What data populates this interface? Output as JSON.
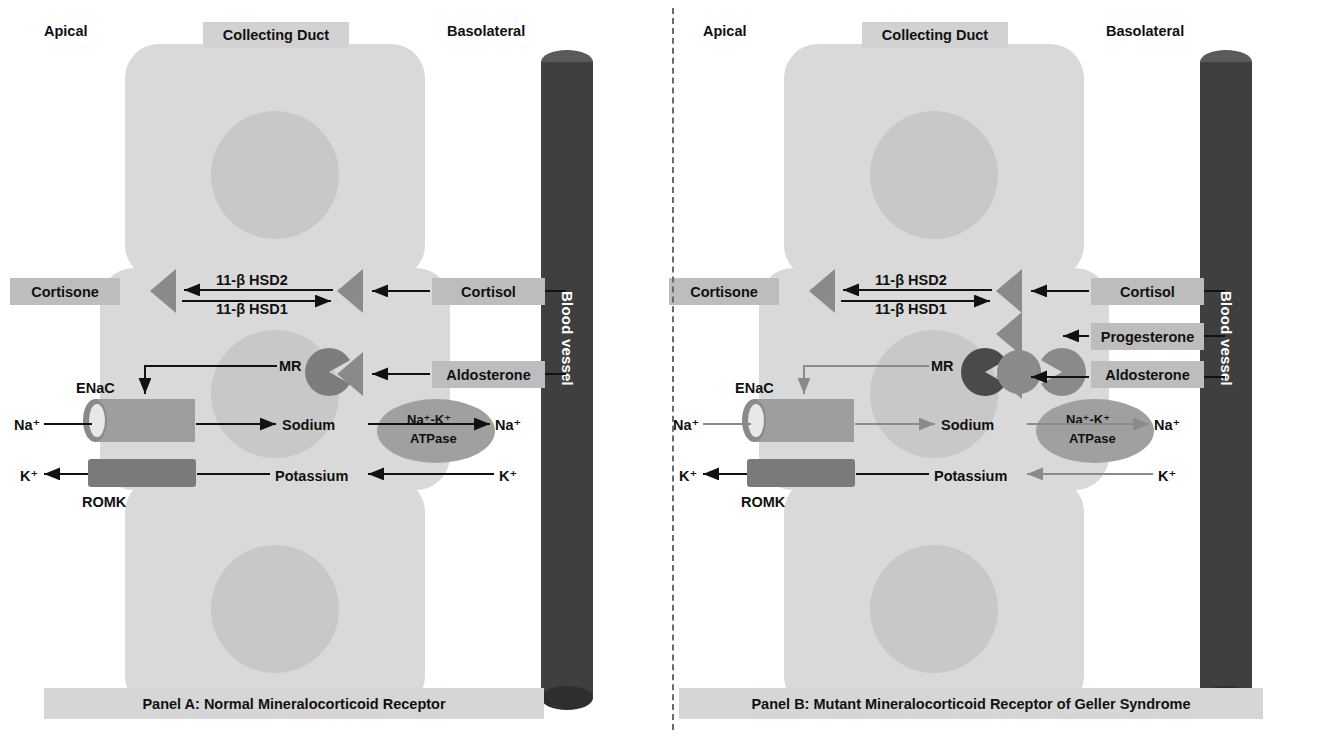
{
  "figure": {
    "colors": {
      "cell": "#d9d9d9",
      "nucleus": "#c8c8c8",
      "vessel": "#3f3f3f",
      "receptor_normal": "#7d7d7d",
      "receptor_mutant": "#4a4a4a",
      "label_box": "#bdbdbd",
      "arrow_active": "#111111",
      "arrow_reduced": "#8a8a8a"
    }
  },
  "panelA": {
    "caption": "Panel A: Normal Mineralocorticoid Receptor",
    "header_apical": "Apical",
    "header_basolateral": "Basolateral",
    "collecting_duct": "Collecting Duct",
    "blood_vessel": "Blood vessel",
    "cortisone": "Cortisone",
    "cortisol": "Cortisol",
    "aldosterone": "Aldosterone",
    "hsd2": "11-β HSD2",
    "hsd1": "11-β HSD1",
    "mr": "MR",
    "enac": "ENaC",
    "romk": "ROMK",
    "sodium": "Sodium",
    "potassium": "Potassium",
    "na_apical": "Na⁺",
    "k_apical": "K⁺",
    "na_baso": "Na⁺",
    "k_baso": "K⁺",
    "atpase_line1": "Na⁺-K⁺",
    "atpase_line2": "ATPase"
  },
  "panelB": {
    "caption": "Panel B: Mutant Mineralocorticoid Receptor of Geller Syndrome",
    "header_apical": "Apical",
    "header_basolateral": "Basolateral",
    "collecting_duct": "Collecting Duct",
    "blood_vessel": "Blood vessel",
    "cortisone": "Cortisone",
    "cortisol": "Cortisol",
    "progesterone": "Progesterone",
    "aldosterone": "Aldosterone",
    "hsd2": "11-β HSD2",
    "hsd1": "11-β HSD1",
    "mr": "MR",
    "enac": "ENaC",
    "romk": "ROMK",
    "sodium": "Sodium",
    "potassium": "Potassium",
    "na_apical": "Na⁺",
    "k_apical": "K⁺",
    "na_baso": "Na⁺",
    "k_baso": "K⁺",
    "atpase_line1": "Na⁺-K⁺",
    "atpase_line2": "ATPase"
  }
}
